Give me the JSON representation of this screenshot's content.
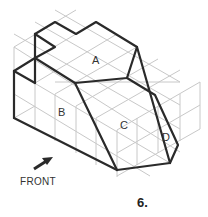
{
  "figure": {
    "number": "6.",
    "faces": [
      {
        "label": "A"
      },
      {
        "label": "B"
      },
      {
        "label": "C"
      },
      {
        "label": "D"
      }
    ],
    "front_label": "FRONT",
    "arrow_icon": "arrow-up-right"
  },
  "colors": {
    "grid": "#c8c8c8",
    "outline": "#2a2a2a",
    "text": "#333333"
  }
}
